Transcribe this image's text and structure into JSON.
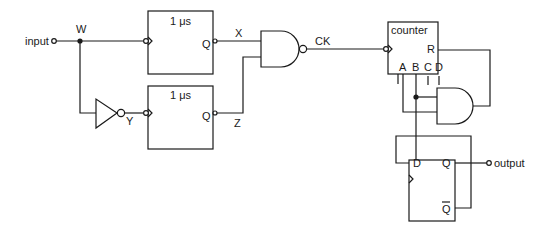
{
  "diagram": {
    "type": "logic circuit",
    "terminals": {
      "input": "input",
      "output": "output"
    },
    "nodes": {
      "w": "W",
      "x": "X",
      "y": "Y",
      "z": "Z",
      "ck": "CK"
    },
    "one_shot_top": {
      "delay": "1 μs",
      "out": "Q"
    },
    "one_shot_bottom": {
      "delay": "1 μs",
      "out": "Q"
    },
    "counter": {
      "title": "counter",
      "reset": "R",
      "outputs": [
        "A",
        "B",
        "C",
        "D"
      ]
    },
    "flip_flop": {
      "d": "D",
      "q": "Q",
      "qbar": "Q"
    },
    "gates": [
      "inverter",
      "nand",
      "and"
    ],
    "colors": {
      "ink": "#1a1a1a",
      "background": "#ffffff"
    }
  }
}
